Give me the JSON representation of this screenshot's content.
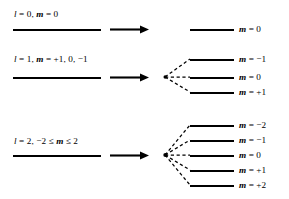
{
  "figure": {
    "type": "energy-level-splitting-diagram",
    "background_color": "#ffffff",
    "line_color": "#000000",
    "width": 289,
    "height": 199
  },
  "groups": [
    {
      "id": "l0",
      "left_label_parts": {
        "l_symbol": "l",
        "l_eq": " = 0,",
        "m_symbol": "m",
        "m_eq": " = 0"
      },
      "left_label_text": "l = 0,  m = 0",
      "left_level_y": 29,
      "arrow_y": 29,
      "arrow_name": "split-arrow",
      "vertex_x": 165,
      "vertex_y": 29,
      "has_fan": false,
      "levels": [
        {
          "m_symbol": "m",
          "m_value": " = 0",
          "label_text": "m = 0",
          "y": 29
        }
      ]
    },
    {
      "id": "l1",
      "left_label_parts": {
        "l_symbol": "l",
        "l_eq": " = 1,",
        "m_symbol": "m",
        "m_eq": " = +1, 0, −1"
      },
      "left_label_text": "l = 1, m = +1, 0, −1",
      "left_level_y": 77,
      "arrow_y": 77,
      "arrow_name": "split-arrow",
      "vertex_x": 165,
      "vertex_y": 77,
      "has_fan": true,
      "levels": [
        {
          "m_symbol": "m",
          "m_value": " = −1",
          "label_text": "m = −1",
          "y": 59
        },
        {
          "m_symbol": "m",
          "m_value": " = 0",
          "label_text": "m = 0",
          "y": 77
        },
        {
          "m_symbol": "m",
          "m_value": " = +1",
          "label_text": "m = +1",
          "y": 92
        }
      ]
    },
    {
      "id": "l2",
      "left_label_parts": {
        "l_symbol": "l",
        "l_eq": " = 2,  −2 ≤ ",
        "m_symbol": "m",
        "m_eq": " ≤ 2"
      },
      "left_label_text": "l = 2, −2 ≤ m ≤ 2",
      "left_level_y": 155,
      "arrow_y": 155,
      "arrow_name": "split-arrow",
      "vertex_x": 165,
      "vertex_y": 155,
      "has_fan": true,
      "levels": [
        {
          "m_symbol": "m",
          "m_value": " = −2",
          "label_text": "m = −2",
          "y": 125
        },
        {
          "m_symbol": "m",
          "m_value": " = −1",
          "label_text": "m = −1",
          "y": 140
        },
        {
          "m_symbol": "m",
          "m_value": " = 0",
          "label_text": "m = 0",
          "y": 155
        },
        {
          "m_symbol": "m",
          "m_value": " = +1",
          "label_text": "m = +1",
          "y": 170
        },
        {
          "m_symbol": "m",
          "m_value": " = +2",
          "label_text": "m = +2",
          "y": 185
        }
      ]
    }
  ]
}
